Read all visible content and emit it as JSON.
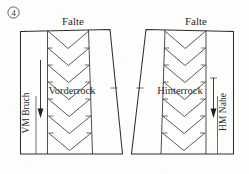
{
  "figure": {
    "number_label": "4",
    "number_circled": true,
    "kind": "sewing-pattern-diagram",
    "background_color": "#fdfdfb",
    "line_color": "#2e2e2e",
    "text_color": "#2b2b2b"
  },
  "panels": [
    {
      "id": "front",
      "name_label": "Vorderrock",
      "top_label": "Falte",
      "edge_label": "VM Bruch",
      "edge_label_side": "left",
      "edge_type": "fold",
      "grainline_direction": "down",
      "pleat_label": "Falte",
      "chevron_count": 7,
      "notch_side": "right"
    },
    {
      "id": "back",
      "name_label": "Hinterrock",
      "top_label": "Falte",
      "edge_label": "HM Nahe",
      "edge_label_side": "right",
      "edge_type": "seam",
      "grainline_direction": "down",
      "pleat_label": "Falte",
      "chevron_count": 7,
      "notch_side": "left"
    }
  ],
  "legend": {
    "falte": "Falte",
    "vorderrock": "Vorderrock",
    "hinterrock": "Hinterrock",
    "vm_bruch": "VM Bruch",
    "hm_nahe": "HM Nahe"
  }
}
